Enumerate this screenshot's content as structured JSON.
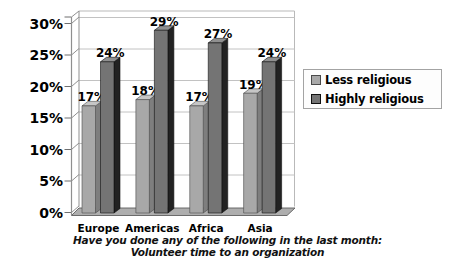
{
  "colors": {
    "background": "#ffffff",
    "plot_border": "#b9b9b9",
    "gridline": "#c2c2c2",
    "axis": "#8f8f8f",
    "tick": "#6f6f6f",
    "floor_fill": "#aeaeae",
    "floor_edge": "#5f5f5f",
    "legend_border": "#a3a3a3",
    "legend_bg": "#fdfdfd",
    "text": "#000000"
  },
  "chart_data": {
    "type": "bar",
    "title_line1": "Have you done any of the following in the last month:",
    "title_line2": "Volunteer time to an organization",
    "categories": [
      "Europe",
      "Americas",
      "Africa",
      "Asia"
    ],
    "series": [
      {
        "name": "Less religious",
        "values": [
          17,
          18,
          17,
          19
        ],
        "front_color": "#a8a8a8",
        "side_color": "#7e7e7e",
        "top_color": "#c6c6c6",
        "edge_color": "#4a4a4a"
      },
      {
        "name": "Highly religious",
        "values": [
          24,
          29,
          27,
          24
        ],
        "front_color": "#747474",
        "side_color": "#222222",
        "top_color": "#909090",
        "edge_color": "#101010"
      }
    ],
    "y_ticks": [
      "0%",
      "5%",
      "10%",
      "15%",
      "20%",
      "25%",
      "30%"
    ],
    "ylim": [
      0,
      30
    ],
    "grid": true,
    "legend_position": "right",
    "data_label_suffix": "%",
    "style_3d": true
  }
}
